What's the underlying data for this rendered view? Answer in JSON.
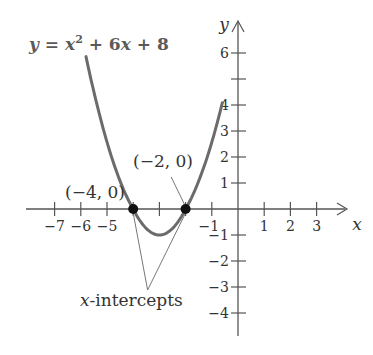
{
  "chart_data": {
    "type": "line",
    "title": "",
    "equation": {
      "lhs": "y",
      "eq": " = ",
      "x": "x",
      "exp": "2",
      "rest": " + 6x + 8"
    },
    "xlabel": "x",
    "ylabel": "y",
    "xlim": [
      -7.5,
      4
    ],
    "ylim": [
      -5,
      6.8
    ],
    "x_ticks": [
      -7,
      -6,
      -5,
      -4,
      -3,
      -2,
      -1,
      1,
      2,
      3
    ],
    "x_tick_labels": [
      {
        "value": -7,
        "label": "−7"
      },
      {
        "value": -6,
        "label": "−6"
      },
      {
        "value": -5,
        "label": "−5"
      },
      {
        "value": -1,
        "label": "−1"
      },
      {
        "value": 1,
        "label": "1"
      },
      {
        "value": 2,
        "label": "2"
      },
      {
        "value": 3,
        "label": "3"
      }
    ],
    "y_ticks": [
      -4,
      -3,
      -2,
      -1,
      1,
      2,
      3,
      4,
      5,
      6
    ],
    "y_tick_labels": [
      {
        "value": 6,
        "label": "6"
      },
      {
        "value": 4,
        "label": "4"
      },
      {
        "value": 3,
        "label": "3"
      },
      {
        "value": 2,
        "label": "2"
      },
      {
        "value": 1,
        "label": "1"
      },
      {
        "value": -1,
        "label": "−1"
      },
      {
        "value": -2,
        "label": "−2"
      },
      {
        "value": -3,
        "label": "−3"
      },
      {
        "value": -4,
        "label": "−4"
      }
    ],
    "grid": false,
    "series": [
      {
        "name": "y = x^2 + 6x + 8",
        "function": "x^2+6x+8",
        "x_range": [
          -5.8,
          -0.6
        ],
        "color": "#6b6b6b"
      }
    ],
    "points": [
      {
        "x": -4,
        "y": 0,
        "label": "(−4, 0)"
      },
      {
        "x": -2,
        "y": 0,
        "label": "(−2, 0)"
      }
    ],
    "annotations": [
      {
        "text": "x-intercepts",
        "italic_prefix": "x",
        "rest": "-intercepts",
        "points_to": [
          [
            -4,
            0
          ],
          [
            -2,
            0
          ]
        ]
      }
    ]
  }
}
